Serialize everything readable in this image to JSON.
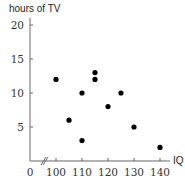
{
  "chart_data": {
    "type": "scatter",
    "title": "",
    "xlabel": "IQ",
    "ylabel": "hours of TV",
    "x_ticks": [
      "0",
      "100",
      "110",
      "120",
      "130",
      "140"
    ],
    "y_ticks": [
      "5",
      "10",
      "15",
      "20"
    ],
    "xlim": [
      95,
      145
    ],
    "ylim": [
      0,
      20
    ],
    "x_axis_break": true,
    "grid": false,
    "legend": null,
    "points": [
      {
        "x": 100,
        "y": 12
      },
      {
        "x": 105,
        "y": 6
      },
      {
        "x": 110,
        "y": 10
      },
      {
        "x": 110,
        "y": 3
      },
      {
        "x": 115,
        "y": 13
      },
      {
        "x": 115,
        "y": 12
      },
      {
        "x": 120,
        "y": 8
      },
      {
        "x": 125,
        "y": 10
      },
      {
        "x": 130,
        "y": 5
      },
      {
        "x": 140,
        "y": 2
      }
    ],
    "colors": {
      "points": "#000000",
      "axis": "#555555"
    }
  }
}
